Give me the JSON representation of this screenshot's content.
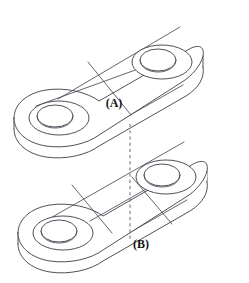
{
  "figure": {
    "background_color": "#ffffff",
    "line_color": "#3c3c46",
    "hidden_line_color": "#6b6b73",
    "label_color": "#111111",
    "width": 249,
    "height": 283
  },
  "labels": {
    "upper": "(A)",
    "lower": "(B)"
  },
  "projection": {
    "name": "vertical-alignment-dashed-line",
    "style": "dashed",
    "from_y": 124,
    "to_y": 239,
    "x": 130
  },
  "parts": [
    {
      "id": "upper-plate",
      "label": "(A)",
      "hole_count": 2,
      "division_lines": 1
    },
    {
      "id": "lower-plate",
      "label": "(B)",
      "hole_count": 2,
      "division_lines": 2
    }
  ]
}
